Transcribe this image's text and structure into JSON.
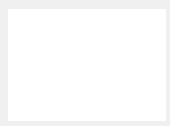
{
  "grid": {
    "origin_px": [
      87,
      105
    ],
    "unit_px": 15.7,
    "x_range": [
      -5,
      5
    ],
    "y_range": [
      -1,
      6
    ],
    "line_color": "#bdbdbd",
    "fill": "#ffffff"
  },
  "axes": {
    "x_label": "x",
    "y_label": "y",
    "origin_label": "O",
    "color": "#1a1a1a"
  },
  "shapes": [
    {
      "name": "triangle-QRS",
      "color": "#2b2b2b",
      "vertices": [
        {
          "label": "Q",
          "x": 2,
          "y": 5
        },
        {
          "label": "R",
          "x": 4,
          "y": 2
        },
        {
          "label": "S",
          "x": 2,
          "y": 1
        }
      ]
    },
    {
      "name": "triangle-Q''R''S''",
      "color": "#7a7a7a",
      "vertices": [
        {
          "label": "Q''",
          "x": -2,
          "y": 5
        },
        {
          "label": "R''",
          "x": -4,
          "y": 2
        },
        {
          "label": "S''",
          "x": -2,
          "y": 1
        }
      ]
    }
  ]
}
